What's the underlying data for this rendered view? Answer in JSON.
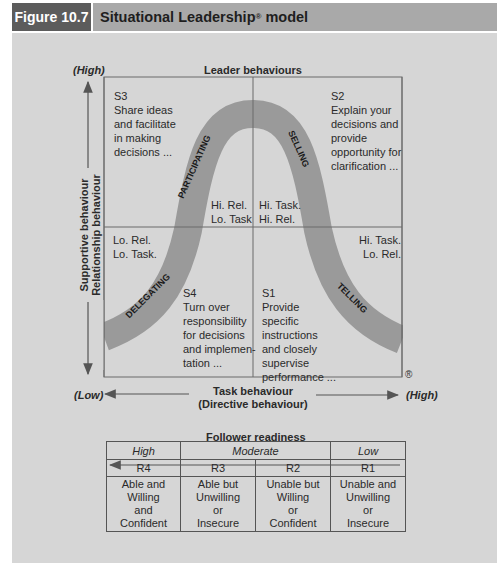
{
  "header": {
    "figure_label": "Figure 10.7",
    "title": "Situational Leadership",
    "title_mark": "®",
    "title_suffix": " model"
  },
  "diagram": {
    "top_label": "Leader behaviours",
    "y_axis": {
      "high": "(High)",
      "low": "(Low)",
      "label_line1": "Supportive behaviour",
      "label_line2": "Relationship behaviour"
    },
    "x_axis": {
      "low": "(Low)",
      "high": "(High)",
      "label_line1": "Task behaviour",
      "label_line2": "(Directive behaviour)"
    },
    "registered_mark": "®",
    "quadrants": {
      "s3": {
        "code": "S3",
        "lines": [
          "Share ideas",
          "and facilitate",
          "in making",
          "decisions ..."
        ],
        "corner": [
          "Hi. Rel.",
          "Lo. Task"
        ]
      },
      "s2": {
        "code": "S2",
        "lines": [
          "Explain your",
          "decisions and",
          "provide",
          "opportunity for",
          "clarification ..."
        ],
        "corner": [
          "Hi. Task.",
          "Hi. Rel."
        ]
      },
      "s4": {
        "code": "S4",
        "lines": [
          "Turn over",
          "responsibility",
          "for decisions",
          "and implemen-",
          "tation ..."
        ],
        "corner": [
          "Lo. Rel.",
          "Lo. Task."
        ]
      },
      "s1": {
        "code": "S1",
        "lines": [
          "Provide",
          "specific",
          "instructions",
          "and closely",
          "supervise",
          "performance ..."
        ],
        "corner": [
          "Hi. Task.",
          "Lo. Rel."
        ]
      }
    },
    "curve_labels": {
      "participating": "PARTICIPATING",
      "selling": "SELLING",
      "delegating": "DELEGATING",
      "telling": "TELLING"
    },
    "colors": {
      "panel_bg": "#d6d6d6",
      "curve": "#9a9a9a",
      "header_dark": "#5c5c5c",
      "header_light": "#a9a9a9"
    }
  },
  "follower_readiness": {
    "title": "Follower readiness",
    "levels": [
      "High",
      "Moderate",
      "Low"
    ],
    "codes": [
      "R4",
      "R3",
      "R2",
      "R1"
    ],
    "descriptions": [
      [
        "Able and",
        "Willing",
        "and",
        "Confident"
      ],
      [
        "Able but",
        "Unwilling",
        "or",
        "Insecure"
      ],
      [
        "Unable but",
        "Willing",
        "or",
        "Confident"
      ],
      [
        "Unable and",
        "Unwilling",
        "or",
        "Insecure"
      ]
    ]
  }
}
